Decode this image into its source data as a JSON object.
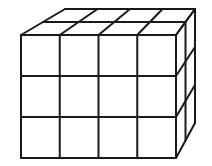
{
  "diagram": {
    "title": "",
    "shape": "rectangular prism of unit cubes",
    "columns": 4,
    "rows": 3,
    "depth": 2,
    "stroke_color": "#1a1a1a",
    "background": "#ffffff"
  }
}
